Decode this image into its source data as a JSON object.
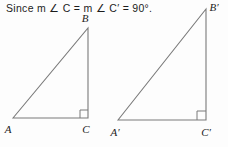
{
  "statement": {
    "text": "Since m ∠ C = m ∠ C′ = 90°."
  },
  "figure": {
    "stroke_color": "#7a7a7a",
    "label_color": "#1c1c1c",
    "background": "#fdfdfd",
    "triangle1": {
      "name": "triangle-abc",
      "vertices": {
        "A": {
          "label": "A",
          "x": 13,
          "y": 118
        },
        "B": {
          "label": "B",
          "x": 88,
          "y": 28
        },
        "C": {
          "label": "C",
          "x": 88,
          "y": 118
        }
      },
      "right_angle_at": "C",
      "right_angle_measure": "90°"
    },
    "triangle2": {
      "name": "triangle-a-prime-b-prime-c-prime",
      "vertices": {
        "A'": {
          "label": "A′",
          "x": 118,
          "y": 120
        },
        "B'": {
          "label": "B′",
          "x": 206,
          "y": 9
        },
        "C'": {
          "label": "C′",
          "x": 206,
          "y": 120
        }
      },
      "right_angle_at": "C'",
      "right_angle_measure": "90°"
    }
  }
}
